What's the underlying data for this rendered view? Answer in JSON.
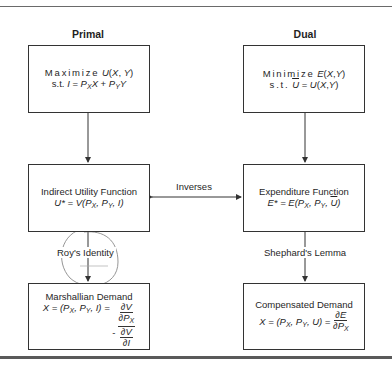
{
  "columns": {
    "primal": "Primal",
    "dual": "Dual"
  },
  "boxes": {
    "primal_problem": {
      "line1_word": "Maximize",
      "line1_expr": "U(X, Y)",
      "line2_prefix": "s.t.",
      "line2_expr": "I = PXX + PYY"
    },
    "dual_problem": {
      "line1_word": "Minimize",
      "line1_expr": "E(X,Y)",
      "line2_prefix": "s.t.",
      "line2_expr": "Ū = U(X,Y)"
    },
    "indirect_utility": {
      "title": "Indirect Utility Function",
      "equation": "U* = V(PX, PY, I)"
    },
    "expenditure": {
      "title": "Expenditure Function",
      "equation": "E* = E(PX, PY, Ū)"
    },
    "marshallian": {
      "title": "Marshallian Demand",
      "equation": "X = (PX, PY, I) = -(∂V/∂PX)/(∂V/∂I)"
    },
    "compensated": {
      "title": "Compensated Demand",
      "equation": "X = (PX, PY, U) = ∂E/∂PX"
    }
  },
  "edges": {
    "inverses": "Inverses",
    "roys_identity": "Roy's Identity",
    "shephards_lemma": "Shephard's Lemma"
  },
  "colors": {
    "line": "#333333",
    "annotation_pen": "#7a7a7a"
  }
}
